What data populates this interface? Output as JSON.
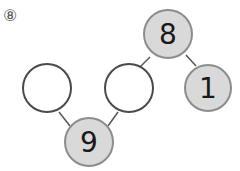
{
  "problem_label": "⑧",
  "colors": {
    "filled": "#d9d9d9",
    "filled_stroke": "#8c8c8c",
    "empty_stroke": "#4a4a4a",
    "line": "#555555"
  },
  "nodes": {
    "top": {
      "value": "8"
    },
    "right": {
      "value": "1"
    },
    "middle": {
      "value": ""
    },
    "left": {
      "value": ""
    },
    "bottom": {
      "value": "9"
    }
  }
}
